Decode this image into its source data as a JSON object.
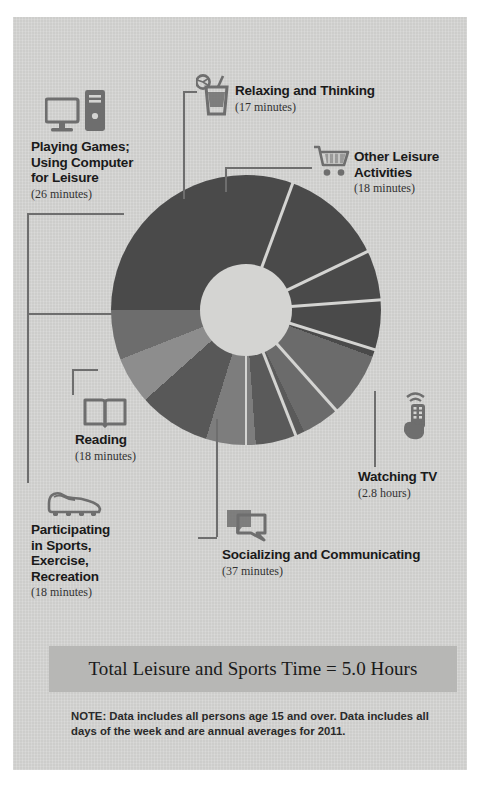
{
  "chart_data": {
    "type": "pie",
    "total_label": "Total Leisure and Sports Time = 5.0 Hours",
    "total_hours": 5.0,
    "unit": "minutes per day",
    "categories": [
      "Watching TV",
      "Socializing and Communicating",
      "Playing Games; Using Computer for Leisure",
      "Reading",
      "Participating in Sports, Exercise, Recreation",
      "Other Leisure Activities",
      "Relaxing and Thinking"
    ],
    "values": [
      168,
      37,
      26,
      18,
      18,
      18,
      17
    ],
    "value_labels": [
      "2.8 hours",
      "37 minutes",
      "26 minutes",
      "18 minutes",
      "18 minutes",
      "18 minutes",
      "17 minutes"
    ],
    "colors": [
      "#4a4a4a",
      "#6b6b6b",
      "#565656",
      "#7a7a7a",
      "#5e5e5e",
      "#8a8a8a",
      "#6f6f6f"
    ],
    "legend": "labeled-callouts",
    "grid": false
  },
  "segments": [
    {
      "name": "Watching TV",
      "value_label": "(2.8 hours)",
      "minutes": 168,
      "color": "#4a4a4a"
    },
    {
      "name": "Socializing and Communicating",
      "value_label": "(37 minutes)",
      "minutes": 37,
      "color": "#6b6b6b"
    },
    {
      "name": "Participating in Sports, Exercise, Recreation",
      "value_label": "(18 minutes)",
      "minutes": 18,
      "color": "#5a5a5a"
    },
    {
      "name": "Reading",
      "value_label": "(18 minutes)",
      "minutes": 18,
      "color": "#7d7d7d"
    },
    {
      "name": "Playing Games; Using Computer for Leisure",
      "value_label": "(26 minutes)",
      "minutes": 26,
      "color": "#585858"
    },
    {
      "name": "Relaxing and Thinking",
      "value_label": "(17 minutes)",
      "minutes": 17,
      "color": "#8d8d8d"
    },
    {
      "name": "Other Leisure Activities",
      "value_label": "(18 minutes)",
      "minutes": 18,
      "color": "#6d6d6d"
    }
  ],
  "callouts": {
    "playing_games": {
      "title": "Playing Games;\nUsing Computer\nfor Leisure",
      "value": "(26 minutes)",
      "icon": "computer-icon"
    },
    "relaxing": {
      "title": "Relaxing and Thinking",
      "value": "(17 minutes)",
      "icon": "drink-icon"
    },
    "other_leisure": {
      "title": "Other Leisure\nActivities",
      "value": "(18 minutes)",
      "icon": "shopping-cart-icon"
    },
    "watching_tv": {
      "title": "Watching TV",
      "value": "(2.8 hours)",
      "icon": "remote-control-icon"
    },
    "socializing": {
      "title": "Socializing and Communicating",
      "value": "(37 minutes)",
      "icon": "speech-bubble-icon"
    },
    "reading": {
      "title": "Reading",
      "value": "(18 minutes)",
      "icon": "open-book-icon"
    },
    "sports": {
      "title": "Participating\nin Sports,\nExercise,\nRecreation",
      "value": "(18 minutes)",
      "icon": "cleat-shoe-icon"
    }
  },
  "banner": {
    "text": "Total Leisure and Sports Time = 5.0 Hours",
    "bg": "#b7b7b5"
  },
  "note": {
    "text": "NOTE: Data includes all persons age 15 and over. Data includes all days of the week and are annual averages for 2011."
  },
  "theme": {
    "panel_bg": "#d4d4d2",
    "ink": "#1a1a1a",
    "leader": "#6e6e6e",
    "icon": "#6e6e6e"
  }
}
